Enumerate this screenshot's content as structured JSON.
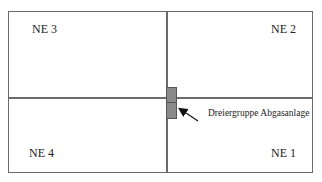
{
  "diagram": {
    "quadrants": [
      {
        "id": "ne3",
        "label": "NE 3",
        "position": "top-left"
      },
      {
        "id": "ne2",
        "label": "NE 2",
        "position": "top-right"
      },
      {
        "id": "ne4",
        "label": "NE 4",
        "position": "bottom-left"
      },
      {
        "id": "ne1",
        "label": "NE 1",
        "position": "bottom-right"
      }
    ],
    "annotation": {
      "label": "Dreiergruppe Abgasanlage"
    },
    "colors": {
      "lines": "#6a6a6a",
      "block": "#8a8a8a"
    }
  }
}
